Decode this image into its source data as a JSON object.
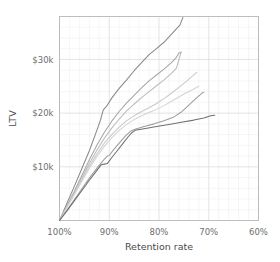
{
  "chart_data": {
    "type": "line",
    "title": "",
    "xlabel": "Retention rate",
    "ylabel": "LTV",
    "xlim": [
      100,
      60
    ],
    "ylim": [
      0,
      38000
    ],
    "x_ticks": [
      100,
      90,
      80,
      70,
      60
    ],
    "x_tick_labels": [
      "100%",
      "90%",
      "80%",
      "70%",
      "60%"
    ],
    "y_ticks": [
      10000,
      20000,
      30000
    ],
    "y_tick_labels": [
      "$10k",
      "$20k",
      "$30k"
    ],
    "x_minor_step": 2,
    "y_minor_step": 2000,
    "grid": true,
    "legend": "none",
    "x_axis_inverted": true,
    "series": [
      {
        "name": "series-1",
        "color": "#8a8a8a",
        "points": [
          [
            100,
            0
          ],
          [
            98.5,
            3200
          ],
          [
            97,
            6400
          ],
          [
            95.5,
            9700
          ],
          [
            94,
            13000
          ],
          [
            92.8,
            16000
          ],
          [
            91.8,
            18600
          ],
          [
            91.2,
            20600
          ],
          [
            90.6,
            21200
          ],
          [
            89.5,
            22800
          ],
          [
            88,
            24600
          ],
          [
            86.5,
            26200
          ],
          [
            85,
            27900
          ],
          [
            83.5,
            29400
          ],
          [
            82,
            30900
          ],
          [
            80.5,
            32000
          ],
          [
            79,
            33200
          ],
          [
            77.8,
            34400
          ],
          [
            76.8,
            35400
          ],
          [
            75.8,
            36400
          ],
          [
            75.2,
            37800
          ]
        ]
      },
      {
        "name": "series-2",
        "color": "#a6a6a6",
        "points": [
          [
            100,
            0
          ],
          [
            98.5,
            2700
          ],
          [
            97,
            5500
          ],
          [
            95.5,
            8400
          ],
          [
            94,
            11300
          ],
          [
            92.5,
            14000
          ],
          [
            91,
            16400
          ],
          [
            89.5,
            18500
          ],
          [
            88,
            20300
          ],
          [
            86.5,
            21900
          ],
          [
            85,
            23300
          ],
          [
            83.5,
            24700
          ],
          [
            82,
            26000
          ],
          [
            80.5,
            27100
          ],
          [
            79,
            28200
          ],
          [
            77.5,
            29400
          ],
          [
            76.5,
            30400
          ],
          [
            76,
            31200
          ],
          [
            75.5,
            31400
          ]
        ]
      },
      {
        "name": "series-3",
        "color": "#bcbcbc",
        "points": [
          [
            100,
            0
          ],
          [
            98.5,
            2600
          ],
          [
            97,
            5200
          ],
          [
            95.5,
            7900
          ],
          [
            94,
            10600
          ],
          [
            92.5,
            13100
          ],
          [
            91,
            15300
          ],
          [
            89.5,
            17200
          ],
          [
            88,
            18900
          ],
          [
            86.5,
            20400
          ],
          [
            85,
            21700
          ],
          [
            83.5,
            22900
          ],
          [
            82,
            24000
          ],
          [
            80.5,
            25100
          ],
          [
            79,
            26200
          ],
          [
            77.5,
            27400
          ],
          [
            76.5,
            28400
          ],
          [
            76,
            29900
          ],
          [
            75.6,
            31300
          ]
        ]
      },
      {
        "name": "series-4",
        "color": "#c9c9c9",
        "points": [
          [
            100,
            0
          ],
          [
            98.5,
            2500
          ],
          [
            97,
            5000
          ],
          [
            95.5,
            7600
          ],
          [
            94,
            10100
          ],
          [
            92.5,
            12400
          ],
          [
            91,
            14400
          ],
          [
            89.5,
            16000
          ],
          [
            88,
            17400
          ],
          [
            86.5,
            18600
          ],
          [
            85,
            19500
          ],
          [
            83.5,
            20300
          ],
          [
            82,
            21000
          ],
          [
            80.5,
            21800
          ],
          [
            79,
            22700
          ],
          [
            77.5,
            23700
          ],
          [
            76,
            24800
          ],
          [
            74.5,
            25900
          ],
          [
            73.2,
            27000
          ],
          [
            72.4,
            27600
          ]
        ]
      },
      {
        "name": "series-5",
        "color": "#d4d4d4",
        "points": [
          [
            100,
            0
          ],
          [
            98.5,
            2400
          ],
          [
            97,
            4800
          ],
          [
            95.5,
            7300
          ],
          [
            94,
            9700
          ],
          [
            92.5,
            11900
          ],
          [
            91,
            13800
          ],
          [
            89.5,
            15400
          ],
          [
            88,
            16800
          ],
          [
            86.5,
            17900
          ],
          [
            85,
            18800
          ],
          [
            83.5,
            19500
          ],
          [
            82,
            20100
          ],
          [
            80.5,
            20700
          ],
          [
            79,
            21400
          ],
          [
            77.5,
            22200
          ],
          [
            76,
            23000
          ],
          [
            74.5,
            23800
          ],
          [
            73,
            24500
          ],
          [
            72,
            25000
          ]
        ]
      },
      {
        "name": "series-6",
        "color": "#9e9e9e",
        "points": [
          [
            100,
            0
          ],
          [
            98.5,
            1900
          ],
          [
            97,
            3900
          ],
          [
            95.5,
            5900
          ],
          [
            94,
            7900
          ],
          [
            92.5,
            9700
          ],
          [
            91.2,
            11200
          ],
          [
            90.4,
            12000
          ],
          [
            90,
            12100
          ],
          [
            89.2,
            13100
          ],
          [
            88,
            14400
          ],
          [
            86.7,
            15800
          ],
          [
            85.6,
            16700
          ],
          [
            84.8,
            17000
          ],
          [
            83,
            17500
          ],
          [
            81,
            18000
          ],
          [
            79,
            18600
          ],
          [
            77,
            19300
          ],
          [
            75.5,
            20200
          ],
          [
            74,
            21500
          ],
          [
            72.5,
            22800
          ],
          [
            71.4,
            23700
          ],
          [
            71,
            23900
          ]
        ]
      },
      {
        "name": "series-7",
        "color": "#707070",
        "points": [
          [
            100,
            0
          ],
          [
            98.5,
            1800
          ],
          [
            97,
            3700
          ],
          [
            95.5,
            5600
          ],
          [
            94,
            7500
          ],
          [
            92.6,
            9200
          ],
          [
            91.6,
            10400
          ],
          [
            91,
            10500
          ],
          [
            90.4,
            10600
          ],
          [
            89.6,
            11600
          ],
          [
            88.4,
            13000
          ],
          [
            87.2,
            14400
          ],
          [
            86.2,
            15600
          ],
          [
            85.4,
            16400
          ],
          [
            84.8,
            16800
          ],
          [
            83,
            17100
          ],
          [
            80.5,
            17500
          ],
          [
            78,
            17900
          ],
          [
            75.5,
            18300
          ],
          [
            73,
            18700
          ],
          [
            71,
            19100
          ],
          [
            69.6,
            19500
          ],
          [
            68.8,
            19600
          ]
        ]
      }
    ]
  },
  "axis": {
    "x_title": "Retention rate",
    "y_title": "LTV"
  }
}
